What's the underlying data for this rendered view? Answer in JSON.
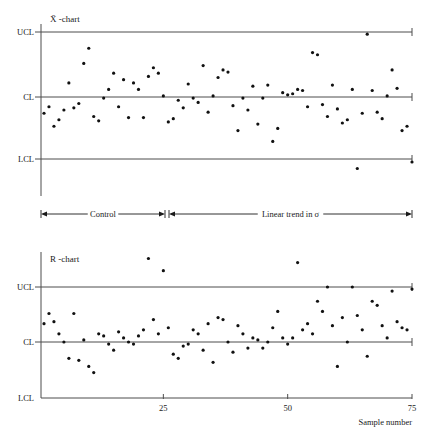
{
  "figure": {
    "background": "#ffffff",
    "point_color": "#111111",
    "line_color": "#4d4d4d"
  },
  "xbar_chart": {
    "title": "X̄ -chart",
    "limit_labels": {
      "ucl": "UCL",
      "cl": "CL",
      "lcl": "LCL"
    }
  },
  "r_chart": {
    "title": "R -chart",
    "limit_labels": {
      "ucl": "UCL",
      "cl": "CL",
      "lcl": "LCL"
    }
  },
  "phase_bar": {
    "segments": [
      {
        "label": "Control"
      },
      {
        "label": "Linear trend in σ"
      }
    ]
  },
  "x_axis": {
    "title": "Sample number",
    "tick_labels": [
      "25",
      "50",
      "75"
    ],
    "tick_values": [
      25,
      50,
      75
    ],
    "range": [
      0,
      76
    ]
  },
  "chart_data": [
    {
      "type": "scatter",
      "title": "X̄ -chart",
      "xlabel": "Sample number",
      "ylabel": "",
      "xlim": [
        0,
        76
      ],
      "ylim": [
        -4.2,
        4.2
      ],
      "grid": false,
      "legend": "none",
      "control_limits": {
        "ucl": 3.0,
        "cl": 0.0,
        "lcl": -3.0
      },
      "annotations": [
        {
          "text": "Control",
          "x_start": 1,
          "x_end": 25
        },
        {
          "text": "Linear trend in σ",
          "x_start": 26,
          "x_end": 75
        }
      ],
      "x": [
        1,
        2,
        3,
        4,
        5,
        6,
        7,
        8,
        9,
        10,
        11,
        12,
        13,
        14,
        15,
        16,
        17,
        18,
        19,
        20,
        21,
        22,
        23,
        24,
        25,
        26,
        27,
        28,
        29,
        30,
        31,
        32,
        33,
        34,
        35,
        36,
        37,
        38,
        39,
        40,
        41,
        42,
        43,
        44,
        45,
        46,
        47,
        48,
        49,
        50,
        51,
        52,
        53,
        54,
        55,
        56,
        57,
        58,
        59,
        60,
        61,
        62,
        63,
        64,
        65,
        66,
        67,
        68,
        69,
        70,
        71,
        72,
        73,
        74,
        75
      ],
      "y": [
        -0.75,
        -0.45,
        -1.35,
        -1.05,
        -0.6,
        0.65,
        -0.5,
        -0.3,
        1.55,
        2.25,
        -0.9,
        -1.1,
        -0.05,
        0.35,
        1.1,
        -0.45,
        0.8,
        -0.95,
        0.65,
        0.35,
        -0.95,
        0.95,
        1.35,
        1.1,
        0.05,
        -1.15,
        -1.0,
        -0.15,
        -0.5,
        0.6,
        -0.05,
        -0.25,
        1.45,
        -0.7,
        0.05,
        0.9,
        1.25,
        1.15,
        -0.4,
        -1.55,
        -0.05,
        -0.6,
        0.5,
        -1.25,
        -0.05,
        0.55,
        -2.05,
        -1.45,
        0.2,
        0.1,
        0.15,
        0.35,
        0.3,
        -0.45,
        2.05,
        1.95,
        -0.35,
        -0.9,
        0.55,
        -0.55,
        -1.2,
        -1.05,
        0.35,
        -3.3,
        -0.75,
        2.9,
        0.3,
        -0.7,
        -1.0,
        0.05,
        1.25,
        0.4,
        -1.55,
        -1.35,
        -3.0
      ]
    },
    {
      "type": "scatter",
      "title": "R -chart",
      "xlabel": "Sample number",
      "ylabel": "",
      "xlim": [
        0,
        76
      ],
      "ylim": [
        -0.2,
        3.4
      ],
      "grid": false,
      "legend": "none",
      "control_limits": {
        "ucl": 2.35,
        "cl": 1.0,
        "lcl": 0.0
      },
      "x": [
        1,
        2,
        3,
        4,
        5,
        6,
        7,
        8,
        9,
        10,
        11,
        12,
        13,
        14,
        15,
        16,
        17,
        18,
        19,
        20,
        21,
        22,
        23,
        24,
        25,
        26,
        27,
        28,
        29,
        30,
        31,
        32,
        33,
        34,
        35,
        36,
        37,
        38,
        39,
        40,
        41,
        42,
        43,
        44,
        45,
        46,
        47,
        48,
        49,
        50,
        51,
        52,
        53,
        54,
        55,
        56,
        57,
        58,
        59,
        60,
        61,
        62,
        63,
        64,
        65,
        66,
        67,
        68,
        69,
        70,
        71,
        72,
        73,
        74,
        75
      ],
      "y": [
        1.45,
        1.7,
        1.5,
        1.2,
        1.0,
        0.6,
        1.7,
        0.55,
        1.05,
        0.4,
        0.25,
        1.2,
        1.15,
        0.95,
        0.8,
        1.25,
        1.1,
        1.0,
        0.95,
        1.15,
        1.3,
        3.05,
        1.55,
        1.2,
        2.75,
        1.35,
        0.7,
        0.6,
        0.9,
        0.95,
        1.3,
        1.2,
        0.8,
        1.45,
        0.5,
        1.6,
        1.55,
        1.0,
        0.75,
        1.4,
        1.2,
        0.85,
        1.1,
        1.05,
        0.85,
        1.0,
        1.35,
        1.75,
        1.1,
        0.95,
        1.1,
        2.95,
        1.3,
        1.45,
        1.2,
        2.0,
        1.75,
        2.35,
        1.4,
        0.4,
        1.6,
        1.0,
        2.35,
        1.65,
        1.3,
        0.65,
        2.0,
        1.9,
        1.4,
        1.1,
        2.25,
        1.5,
        1.35,
        1.3,
        2.3
      ]
    }
  ]
}
